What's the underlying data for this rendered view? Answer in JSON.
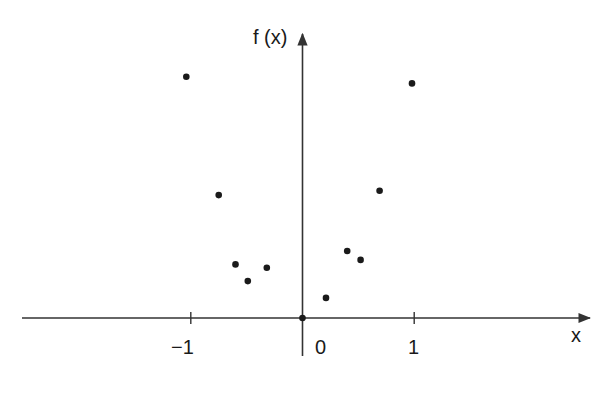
{
  "chart_data": {
    "type": "scatter",
    "title": "",
    "xlabel": "x",
    "ylabel": "f (x)",
    "x_ticks": [
      -1,
      0,
      1
    ],
    "x_tick_labels": [
      "−1",
      "0",
      "1"
    ],
    "y_ticks": [],
    "grid": false,
    "legend": null,
    "xlim": [
      -2.5,
      2.6
    ],
    "ylim": [
      -0.4,
      2.5
    ],
    "series": [
      {
        "name": "f(x) samples",
        "x": [
          -1.04,
          -0.75,
          -0.6,
          -0.49,
          -0.32,
          0.0,
          0.21,
          0.4,
          0.52,
          0.69,
          0.98
        ],
        "y": [
          2.16,
          1.1,
          0.48,
          0.33,
          0.45,
          0.0,
          0.18,
          0.6,
          0.52,
          1.14,
          2.1
        ]
      }
    ]
  },
  "axes": {
    "y_label": "f (x)",
    "x_label": "x",
    "ticks": {
      "neg1": "−1",
      "zero": "0",
      "one": "1"
    }
  },
  "colors": {
    "ink": "#1a1a1a",
    "axis": "#333333",
    "background": "#ffffff"
  }
}
